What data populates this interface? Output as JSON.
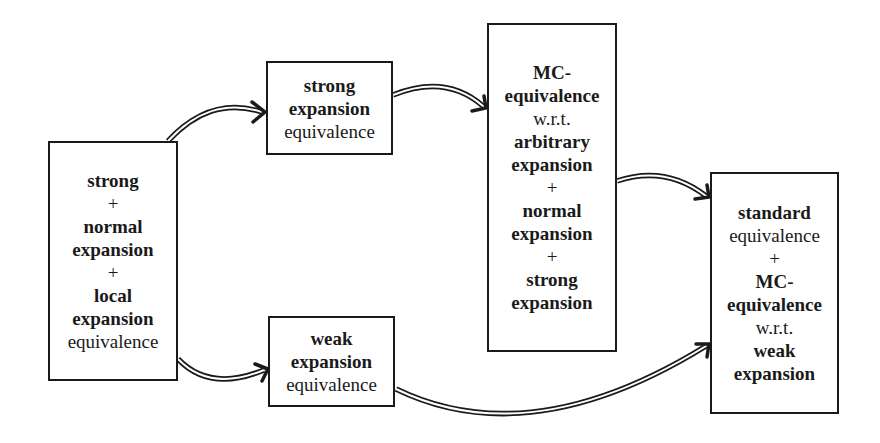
{
  "diagram": {
    "nodes": {
      "left": {
        "lines": [
          {
            "text": "strong",
            "style": "bold"
          },
          {
            "text": "+",
            "style": "normal"
          },
          {
            "text": "normal",
            "style": "bold"
          },
          {
            "text": "expansion",
            "style": "bold"
          },
          {
            "text": "+",
            "style": "normal"
          },
          {
            "text": "local",
            "style": "bold"
          },
          {
            "text": "expansion",
            "style": "bold"
          },
          {
            "text": "equivalence",
            "style": "normal"
          }
        ]
      },
      "strong_expansion": {
        "lines": [
          {
            "text": "strong",
            "style": "bold"
          },
          {
            "text": "expansion",
            "style": "bold"
          },
          {
            "text": "equivalence",
            "style": "normal"
          }
        ]
      },
      "weak_expansion": {
        "lines": [
          {
            "text": "weak",
            "style": "bold"
          },
          {
            "text": "expansion",
            "style": "bold"
          },
          {
            "text": "equivalence",
            "style": "normal"
          }
        ]
      },
      "mc_arbitrary": {
        "lines": [
          {
            "text": "MC-",
            "style": "bold"
          },
          {
            "text": "equivalence",
            "style": "bold"
          },
          {
            "text": "w.r.t.",
            "style": "normal"
          },
          {
            "text": "arbitrary",
            "style": "bold"
          },
          {
            "text": "expansion",
            "style": "bold"
          },
          {
            "text": "+",
            "style": "normal"
          },
          {
            "text": "normal",
            "style": "bold"
          },
          {
            "text": "expansion",
            "style": "bold"
          },
          {
            "text": "+",
            "style": "normal"
          },
          {
            "text": "strong",
            "style": "bold"
          },
          {
            "text": "expansion",
            "style": "bold"
          }
        ]
      },
      "standard": {
        "lines": [
          {
            "text": "standard",
            "style": "bold"
          },
          {
            "text": "equivalence",
            "style": "normal"
          },
          {
            "text": "+",
            "style": "normal"
          },
          {
            "text": "MC-",
            "style": "bold"
          },
          {
            "text": "equivalence",
            "style": "bold"
          },
          {
            "text": "w.r.t.",
            "style": "normal"
          },
          {
            "text": "weak",
            "style": "bold"
          },
          {
            "text": "expansion",
            "style": "bold"
          }
        ]
      }
    },
    "edges": [
      {
        "from": "left",
        "to": "strong_expansion",
        "style": "double-arrow"
      },
      {
        "from": "left",
        "to": "weak_expansion",
        "style": "double-arrow"
      },
      {
        "from": "strong_expansion",
        "to": "mc_arbitrary",
        "style": "double-arrow"
      },
      {
        "from": "mc_arbitrary",
        "to": "standard",
        "style": "double-arrow"
      },
      {
        "from": "weak_expansion",
        "to": "standard",
        "style": "double-arrow"
      }
    ],
    "colors": {
      "stroke": "#1a1a1a",
      "background": "#ffffff"
    }
  }
}
